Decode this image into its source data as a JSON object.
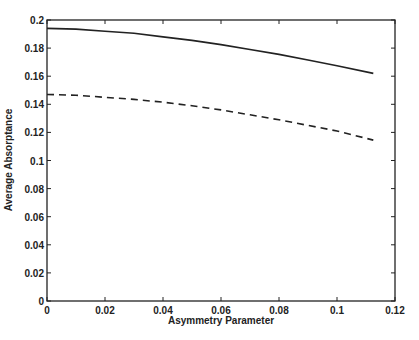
{
  "chart_data": {
    "type": "line",
    "title": "",
    "xlabel": "Asymmetry Parameter",
    "ylabel": "Average Absorptance",
    "xlim": [
      0,
      0.12
    ],
    "ylim": [
      0,
      0.2
    ],
    "xticks": [
      "0",
      "0.02",
      "0.04",
      "0.06",
      "0.08",
      "0.1",
      "0.12"
    ],
    "yticks": [
      "0",
      "0.02",
      "0.04",
      "0.06",
      "0.08",
      "0.1",
      "0.12",
      "0.14",
      "0.16",
      "0.18",
      "0.2"
    ],
    "grid": false,
    "legend": null,
    "series": [
      {
        "name": "solid",
        "style": "solid",
        "x": [
          0,
          0.01,
          0.02,
          0.03,
          0.04,
          0.05,
          0.06,
          0.07,
          0.08,
          0.09,
          0.1,
          0.1125
        ],
        "y": [
          0.194,
          0.1935,
          0.192,
          0.1905,
          0.188,
          0.1855,
          0.1825,
          0.179,
          0.1755,
          0.1715,
          0.1675,
          0.162
        ]
      },
      {
        "name": "dashed",
        "style": "dashed",
        "x": [
          0,
          0.01,
          0.02,
          0.03,
          0.04,
          0.05,
          0.06,
          0.07,
          0.08,
          0.09,
          0.1,
          0.1125
        ],
        "y": [
          0.147,
          0.1465,
          0.145,
          0.1435,
          0.1415,
          0.139,
          0.136,
          0.1325,
          0.129,
          0.125,
          0.121,
          0.1145
        ]
      }
    ]
  }
}
